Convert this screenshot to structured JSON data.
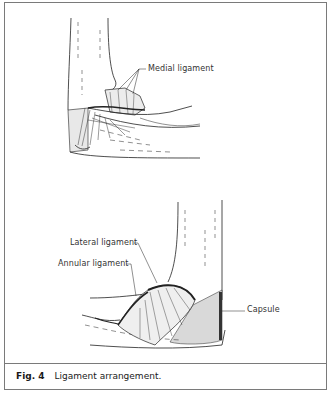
{
  "figure": {
    "number_label": "Fig. 4",
    "caption": "Ligament arrangement."
  },
  "top_illustration": {
    "labels": [
      {
        "text": "Medial ligament"
      }
    ]
  },
  "bottom_illustration": {
    "labels": [
      {
        "text": "Lateral ligament"
      },
      {
        "text": "Annular ligament"
      },
      {
        "text": "Capsule"
      }
    ]
  },
  "colors": {
    "border": "#7a7a7a",
    "ink": "#1a1a1a"
  }
}
